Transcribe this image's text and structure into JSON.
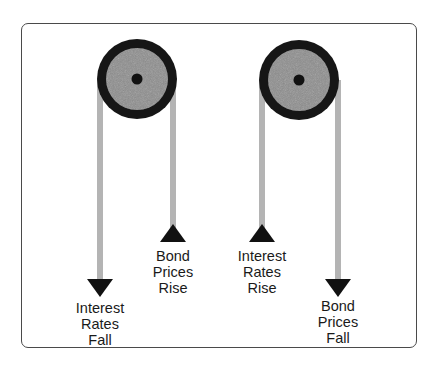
{
  "diagram": {
    "title_visible": false,
    "colors": {
      "frame": "#4a4a4a",
      "pulley_rim": "#161616",
      "pulley_disk": "#8c8c8c",
      "rope": "#b4b4b4",
      "arrowhead": "#111111",
      "text": "#1a1a1a"
    },
    "pulleys": [
      {
        "name": "left-pulley",
        "left_rope": {
          "direction": "down",
          "label": [
            "Interest",
            "Rates",
            "Fall"
          ]
        },
        "right_rope": {
          "direction": "up",
          "label": [
            "Bond",
            "Prices",
            "Rise"
          ]
        }
      },
      {
        "name": "right-pulley",
        "left_rope": {
          "direction": "up",
          "label": [
            "Interest",
            "Rates",
            "Rise"
          ]
        },
        "right_rope": {
          "direction": "down",
          "label": [
            "Bond",
            "Prices",
            "Fall"
          ]
        }
      }
    ]
  }
}
